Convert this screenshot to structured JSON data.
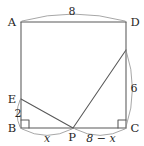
{
  "figure": {
    "kind": "geometry-diagram",
    "stroke_color": "#585858",
    "label_color": "#262626",
    "background": "#ffffff"
  },
  "vertices": [
    {
      "id": "A",
      "label": "A",
      "x": 21,
      "y": 22
    },
    {
      "id": "D",
      "label": "D",
      "x": 126,
      "y": 22
    },
    {
      "id": "B",
      "label": "B",
      "x": 21,
      "y": 128
    },
    {
      "id": "C",
      "label": "C",
      "x": 126,
      "y": 128
    },
    {
      "id": "E",
      "label": "E",
      "x": 21,
      "y": 99
    },
    {
      "id": "P",
      "label": "P",
      "x": 73,
      "y": 128
    },
    {
      "id": "F",
      "label": "",
      "x": 126,
      "y": 50
    }
  ],
  "dimensions": {
    "top": {
      "label": "8",
      "from": "A",
      "to": "D"
    },
    "right": {
      "label": "6",
      "from": "F",
      "to": "C"
    },
    "left_lower": {
      "label": "2",
      "from": "E",
      "to": "B"
    },
    "bottom_left": {
      "label": "x",
      "from": "B",
      "to": "P"
    },
    "bottom_right": {
      "label": "8 − x",
      "from": "P",
      "to": "C"
    }
  },
  "right_angles": [
    {
      "at": "B",
      "name": "right-angle-mark-b"
    },
    {
      "at": "C",
      "name": "right-angle-mark-c"
    }
  ],
  "segments": [
    {
      "name": "side-ad",
      "from": "A",
      "to": "D"
    },
    {
      "name": "side-ab",
      "from": "A",
      "to": "B"
    },
    {
      "name": "side-bc",
      "from": "B",
      "to": "C"
    },
    {
      "name": "side-dc",
      "from": "D",
      "to": "C"
    },
    {
      "name": "crease-ep",
      "from": "E",
      "to": "P"
    },
    {
      "name": "segment-pf",
      "from": "P",
      "to": "F"
    }
  ]
}
